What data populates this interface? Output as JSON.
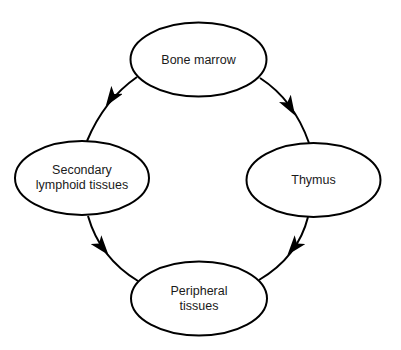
{
  "diagram": {
    "type": "cycle",
    "colors": {
      "stroke": "#000000",
      "text": "#1a1a1a",
      "background": "#ffffff"
    },
    "nodes": [
      {
        "id": "bone-marrow",
        "line1": "Bone marrow",
        "line2": "",
        "cx": 198.5,
        "cy": 59.5,
        "rx": 68,
        "ry": 37
      },
      {
        "id": "secondary-lymphoid",
        "line1": "Secondary",
        "line2": "lymphoid tissues",
        "cx": 82,
        "cy": 178,
        "rx": 67,
        "ry": 37
      },
      {
        "id": "thymus",
        "line1": "Thymus",
        "line2": "",
        "cx": 313.5,
        "cy": 180,
        "rx": 67,
        "ry": 37
      },
      {
        "id": "peripheral-tissues",
        "line1": "Peripheral",
        "line2": "tissues",
        "cx": 199,
        "cy": 298.5,
        "rx": 68,
        "ry": 37
      }
    ],
    "edges": [
      {
        "from": "bone-marrow",
        "to": "secondary-lymphoid"
      },
      {
        "from": "bone-marrow",
        "to": "thymus"
      },
      {
        "from": "secondary-lymphoid",
        "to": "peripheral-tissues"
      },
      {
        "from": "thymus",
        "to": "peripheral-tissues"
      }
    ]
  }
}
